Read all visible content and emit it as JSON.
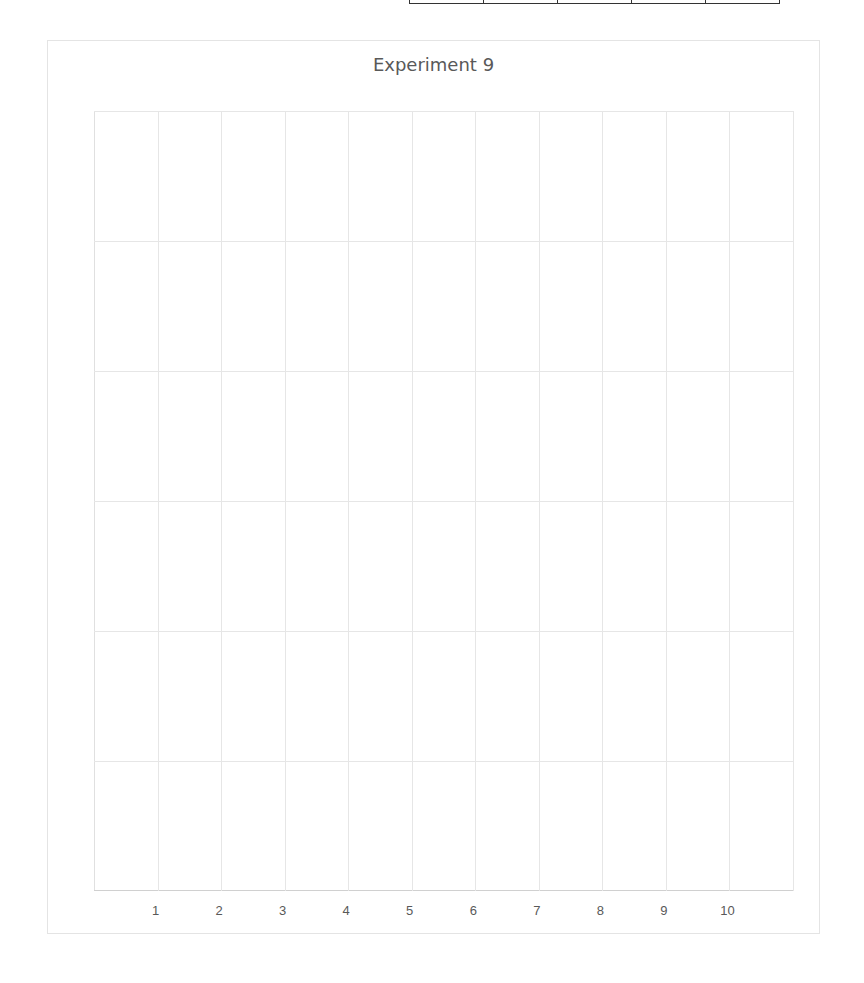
{
  "chart_data": {
    "type": "line",
    "title": "Experiment 9",
    "categories": [
      "1",
      "2",
      "3",
      "4",
      "5",
      "6",
      "7",
      "8",
      "9",
      "10"
    ],
    "series": [],
    "xlabel": "",
    "ylabel": "",
    "y_tick_labels": [],
    "horizontal_gridlines": 6,
    "grid": true,
    "legend": null
  },
  "top_table": {
    "columns": 5
  },
  "colors": {
    "grid": "#e6e6e6",
    "text": "#595959",
    "frame": "#e4e4e4"
  }
}
